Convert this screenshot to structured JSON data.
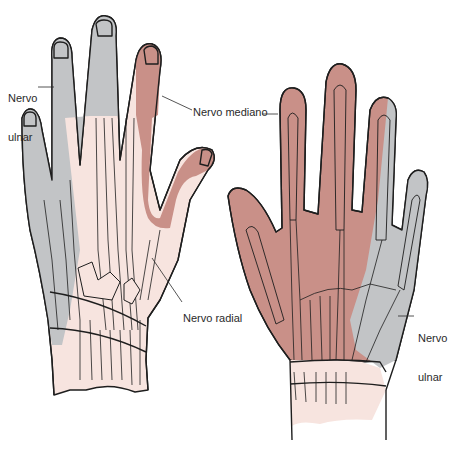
{
  "diagram": {
    "colors": {
      "ulnar": "#c2c4c6",
      "median": "#c99088",
      "radial": "#f7e4df",
      "outline": "#1e1e1e",
      "background": "#ffffff"
    },
    "labels": {
      "dorsal_ulnar_line1": "Nervo",
      "dorsal_ulnar_line2": "ulnar",
      "median": "Nervo mediano",
      "radial": "Nervo radial",
      "palmar_ulnar_line1": "Nervo",
      "palmar_ulnar_line2": "ulnar"
    },
    "views": [
      {
        "name": "dorsal",
        "position": "left"
      },
      {
        "name": "palmar",
        "position": "right"
      }
    ]
  }
}
